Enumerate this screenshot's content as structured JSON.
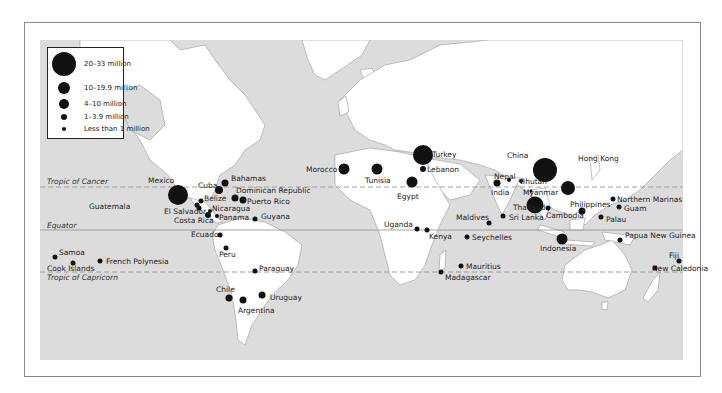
{
  "legend": {
    "items": [
      {
        "label": "20–33 million",
        "size": 30
      },
      {
        "label": "10–19.9 million",
        "size": 15
      },
      {
        "label": "4–10 million",
        "size": 11
      },
      {
        "label": "1–3.9 million",
        "size": 7
      },
      {
        "label": "Less than 1 million",
        "size": 5
      }
    ]
  },
  "lines": {
    "cancer": "Tropic of Cancer",
    "equator": "Equator",
    "capricorn": "Tropic of Capricorn"
  },
  "colors": {
    "ocean": "#dcdcdc",
    "land": "#ffffff",
    "dot": "#111111",
    "frame": "#8a8a8a"
  },
  "destinations": [
    {
      "name": "Mexico",
      "x": 178,
      "y": 195,
      "size": 20,
      "lx": 148,
      "ly": 177
    },
    {
      "name": "Guatemala",
      "x": 197,
      "y": 205,
      "size": 5,
      "lx": 89,
      "ly": 203
    },
    {
      "name": "Belize",
      "x": 201,
      "y": 201,
      "size": 5,
      "lx": 204,
      "ly": 195
    },
    {
      "name": "El Salvador",
      "x": 199,
      "y": 208,
      "size": 5,
      "lx": 164,
      "ly": 208
    },
    {
      "name": "Costa Rica",
      "x": 208,
      "y": 215,
      "size": 6,
      "lx": 174,
      "ly": 217
    },
    {
      "name": "Nicaragua",
      "x": 210,
      "y": 211,
      "size": 4,
      "lx": 212,
      "ly": 205
    },
    {
      "name": "Panama",
      "x": 217,
      "y": 216,
      "size": 4,
      "lx": 219,
      "ly": 214
    },
    {
      "name": "Cuba",
      "x": 219,
      "y": 190,
      "size": 8,
      "lx": 198,
      "ly": 182
    },
    {
      "name": "Bahamas",
      "x": 225,
      "y": 183,
      "size": 7,
      "lx": 231,
      "ly": 175
    },
    {
      "name": "Dominican Republic",
      "x": 235,
      "y": 198,
      "size": 7,
      "lx": 236,
      "ly": 187
    },
    {
      "name": "Puerto Rico",
      "x": 243,
      "y": 200,
      "size": 7,
      "lx": 247,
      "ly": 198
    },
    {
      "name": "Guyana",
      "x": 255,
      "y": 219,
      "size": 5,
      "lx": 261,
      "ly": 213
    },
    {
      "name": "Ecuador",
      "x": 220,
      "y": 235,
      "size": 5,
      "lx": 191,
      "ly": 231
    },
    {
      "name": "Peru",
      "x": 226,
      "y": 248,
      "size": 5,
      "lx": 219,
      "ly": 251
    },
    {
      "name": "Paraguay",
      "x": 255,
      "y": 271,
      "size": 5,
      "lx": 259,
      "ly": 265
    },
    {
      "name": "Chile",
      "x": 229,
      "y": 298,
      "size": 7,
      "lx": 216,
      "ly": 286
    },
    {
      "name": "Argentina",
      "x": 243,
      "y": 300,
      "size": 7,
      "lx": 238,
      "ly": 307
    },
    {
      "name": "Uruguay",
      "x": 262,
      "y": 295,
      "size": 7,
      "lx": 270,
      "ly": 294
    },
    {
      "name": "Samoa",
      "x": 55,
      "y": 257,
      "size": 5,
      "lx": 59,
      "ly": 249
    },
    {
      "name": "Cook Islands",
      "x": 73,
      "y": 263,
      "size": 5,
      "lx": 47,
      "ly": 265
    },
    {
      "name": "French Polynesia",
      "x": 100,
      "y": 261,
      "size": 5,
      "lx": 106,
      "ly": 258
    },
    {
      "name": "Morocco",
      "x": 344,
      "y": 169,
      "size": 11,
      "lx": 306,
      "ly": 166
    },
    {
      "name": "Tunisia",
      "x": 377,
      "y": 169,
      "size": 11,
      "lx": 365,
      "ly": 177
    },
    {
      "name": "Turkey",
      "x": 423,
      "y": 155,
      "size": 20,
      "lx": 432,
      "ly": 151
    },
    {
      "name": "Lebanon",
      "x": 423,
      "y": 169,
      "size": 6,
      "lx": 427,
      "ly": 166
    },
    {
      "name": "Egypt",
      "x": 412,
      "y": 182,
      "size": 11,
      "lx": 397,
      "ly": 193
    },
    {
      "name": "Uganda",
      "x": 417,
      "y": 229,
      "size": 5,
      "lx": 384,
      "ly": 221
    },
    {
      "name": "Kenya",
      "x": 427,
      "y": 230,
      "size": 5,
      "lx": 429,
      "ly": 233
    },
    {
      "name": "Seychelles",
      "x": 467,
      "y": 237,
      "size": 5,
      "lx": 472,
      "ly": 234
    },
    {
      "name": "Madagascar",
      "x": 441,
      "y": 272,
      "size": 5,
      "lx": 445,
      "ly": 274
    },
    {
      "name": "Mauritius",
      "x": 461,
      "y": 266,
      "size": 5,
      "lx": 466,
      "ly": 263
    },
    {
      "name": "Maldives",
      "x": 489,
      "y": 223,
      "size": 5,
      "lx": 456,
      "ly": 214
    },
    {
      "name": "Sri Lanka",
      "x": 503,
      "y": 216,
      "size": 5,
      "lx": 509,
      "ly": 214
    },
    {
      "name": "India",
      "x": 497,
      "y": 183,
      "size": 7,
      "lx": 491,
      "ly": 189
    },
    {
      "name": "Nepal",
      "x": 509,
      "y": 180,
      "size": 4,
      "lx": 494,
      "ly": 173
    },
    {
      "name": "Bhutan",
      "x": 521,
      "y": 181,
      "size": 4,
      "lx": 520,
      "ly": 178
    },
    {
      "name": "Myanmar",
      "x": 531,
      "y": 191,
      "size": 3,
      "lx": 523,
      "ly": 189
    },
    {
      "name": "China",
      "x": 545,
      "y": 170,
      "size": 24,
      "lx": 507,
      "ly": 152
    },
    {
      "name": "Hong Kong",
      "x": 568,
      "y": 188,
      "size": 14,
      "lx": 578,
      "ly": 155
    },
    {
      "name": "Thailand",
      "x": 535,
      "y": 205,
      "size": 17,
      "lx": 513,
      "ly": 204
    },
    {
      "name": "Cambodia",
      "x": 548,
      "y": 208,
      "size": 5,
      "lx": 546,
      "ly": 212
    },
    {
      "name": "Philippines",
      "x": 582,
      "y": 211,
      "size": 7,
      "lx": 570,
      "ly": 201
    },
    {
      "name": "Indonesia",
      "x": 562,
      "y": 239,
      "size": 11,
      "lx": 540,
      "ly": 245
    },
    {
      "name": "Northern Marinas",
      "x": 613,
      "y": 199,
      "size": 5,
      "lx": 617,
      "ly": 196
    },
    {
      "name": "Guam",
      "x": 619,
      "y": 207,
      "size": 5,
      "lx": 624,
      "ly": 205
    },
    {
      "name": "Palau",
      "x": 601,
      "y": 217,
      "size": 5,
      "lx": 606,
      "ly": 216
    },
    {
      "name": "Papua New Guinea",
      "x": 620,
      "y": 240,
      "size": 5,
      "lx": 625,
      "ly": 232
    },
    {
      "name": "Fiji",
      "x": 679,
      "y": 261,
      "size": 5,
      "lx": 669,
      "ly": 252
    },
    {
      "name": "New Caledonia",
      "x": 655,
      "y": 268,
      "size": 5,
      "lx": 652,
      "ly": 265
    }
  ]
}
